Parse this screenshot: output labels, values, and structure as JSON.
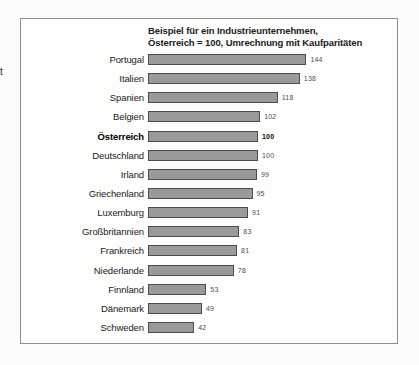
{
  "page": {
    "stray_text": "t"
  },
  "chart": {
    "title_line1": "Beispiel für ein Industrieunternehmen,",
    "title_line2": "Österreich = 100, Umrechnung mit Kaufparitäten"
  },
  "chart_data": {
    "type": "bar",
    "orientation": "horizontal",
    "title": "Beispiel für ein Industrieunternehmen, Österreich = 100, Umrechnung mit Kaufparitäten",
    "categories": [
      "Portugal",
      "Italien",
      "Spanien",
      "Belgien",
      "Österreich",
      "Deutschland",
      "Irland",
      "Griechenland",
      "Luxemburg",
      "Großbritannien",
      "Frankreich",
      "Niederlande",
      "Finnland",
      "Dänemark",
      "Schweden"
    ],
    "values": [
      144,
      138,
      118,
      102,
      100,
      100,
      99,
      95,
      91,
      83,
      81,
      78,
      53,
      49,
      42
    ],
    "emphasized_category": "Österreich",
    "value_labels_shown": true,
    "xlim": [
      0,
      160
    ],
    "grid": false,
    "legend": false,
    "bar_color": "#9a9a9a",
    "bar_border_color": "#4c4c4c",
    "px_per_unit": 1.1
  }
}
